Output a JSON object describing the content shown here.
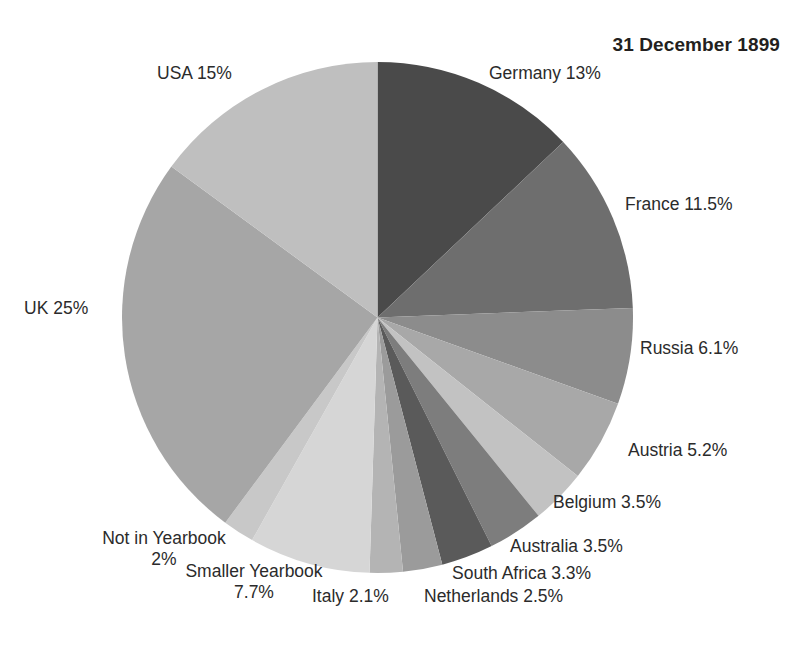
{
  "chart": {
    "title": "31 December 1899",
    "type": "pie"
  },
  "chart_data": {
    "type": "pie",
    "title": "31 December 1899",
    "xlabel": "",
    "ylabel": "",
    "legend_position": "none",
    "grid": false,
    "start_angle_deg": 0,
    "direction": "clockwise",
    "labels": [
      "Germany",
      "France",
      "Russia",
      "Austria",
      "Belgium",
      "Australia",
      "South Africa",
      "Netherlands",
      "Italy",
      "Smaller Yearbook",
      "Not in Yearbook",
      "UK",
      "USA"
    ],
    "values": [
      13,
      11.5,
      6.1,
      5.2,
      3.5,
      3.5,
      3.3,
      2.5,
      2.1,
      7.7,
      2,
      25,
      15
    ],
    "value_suffix": "%",
    "slices": [
      {
        "name": "Germany",
        "value": 13,
        "display": "Germany 13%",
        "color": "#4a4a4a"
      },
      {
        "name": "France",
        "value": 11.5,
        "display": "France 11.5%",
        "color": "#6e6e6e"
      },
      {
        "name": "Russia",
        "value": 6.1,
        "display": "Russia 6.1%",
        "color": "#8c8c8c"
      },
      {
        "name": "Austria",
        "value": 5.2,
        "display": "Austria 5.2%",
        "color": "#a8a8a8"
      },
      {
        "name": "Belgium",
        "value": 3.5,
        "display": "Belgium 3.5%",
        "color": "#c2c2c2"
      },
      {
        "name": "Australia",
        "value": 3.5,
        "display": "Australia 3.5%",
        "color": "#7d7d7d"
      },
      {
        "name": "South Africa",
        "value": 3.3,
        "display": "South Africa 3.3%",
        "color": "#5a5a5a"
      },
      {
        "name": "Netherlands",
        "value": 2.5,
        "display": "Netherlands 2.5%",
        "color": "#9b9b9b"
      },
      {
        "name": "Italy",
        "value": 2.1,
        "display": "Italy 2.1%",
        "color": "#b4b4b4"
      },
      {
        "name": "Smaller Yearbook",
        "value": 7.7,
        "display": "Smaller Yearbook 7.7%",
        "color": "#d6d6d6"
      },
      {
        "name": "Not in Yearbook",
        "value": 2,
        "display": "Not in Yearbook 2%",
        "color": "#c8c8c8"
      },
      {
        "name": "UK",
        "value": 25,
        "display": "UK 25%",
        "color": "#a6a6a6"
      },
      {
        "name": "USA",
        "value": 15,
        "display": "USA 15%",
        "color": "#bfbfbf"
      }
    ]
  },
  "labels": {
    "germany": "Germany 13%",
    "france": "France 11.5%",
    "russia": "Russia 6.1%",
    "austria": "Austria 5.2%",
    "belgium": "Belgium 3.5%",
    "australia": "Australia 3.5%",
    "south_africa": "South Africa 3.3%",
    "netherlands": "Netherlands 2.5%",
    "italy": "Italy 2.1%",
    "smaller_yearbook_name": "Smaller Yearbook",
    "smaller_yearbook_value": "7.7%",
    "not_in_yearbook_name": "Not in Yearbook",
    "not_in_yearbook_value": "2%",
    "uk": "UK 25%",
    "usa": "USA 15%"
  }
}
